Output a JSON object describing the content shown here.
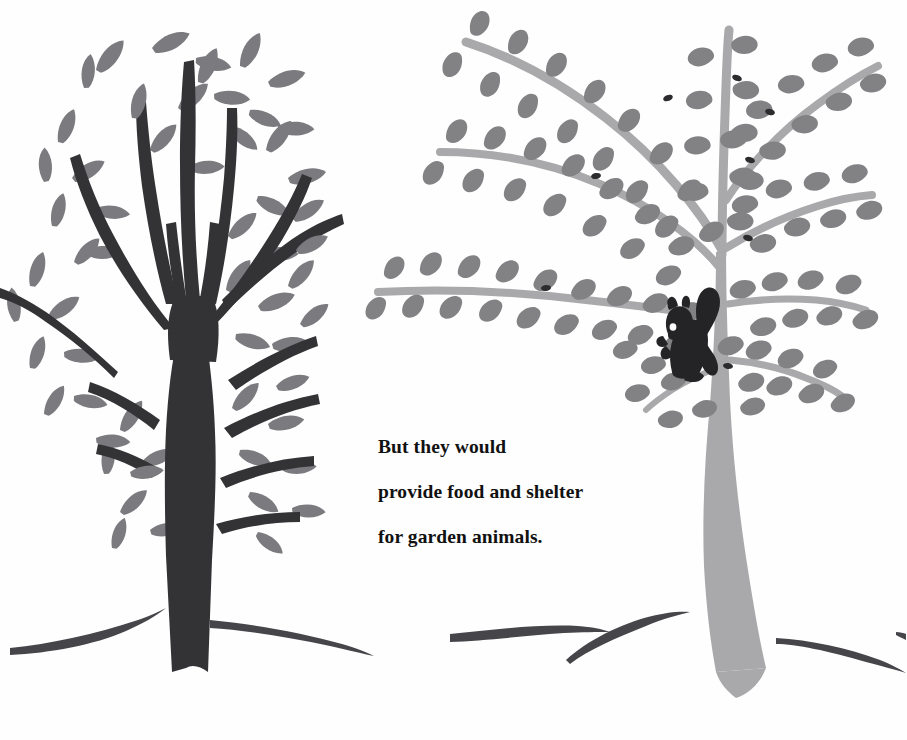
{
  "page": {
    "background_color": "#fefefe",
    "width": 907,
    "height": 740
  },
  "caption": {
    "full_text": "But they would provide food and shelter for garden animals.",
    "lines": [
      "But they would",
      "provide food and shelter",
      "for garden animals."
    ],
    "text_color": "#111111"
  },
  "palette": {
    "background": "#fefefe",
    "dark_tree": "#333235",
    "dark_tree_leaf": "#7b7a7e",
    "light_tree_trunk": "#a9a9ab",
    "light_tree_leaf": "#828285",
    "squirrel": "#242326",
    "squirrel_eye": "#fdfdfd",
    "ground_stroke": "#45454a"
  },
  "illustration": {
    "type": "paper-cut-collage",
    "description": "Two stylized trees on a white background with curved ground strokes and a squirrel.",
    "elements": [
      {
        "name": "dark-tree",
        "label": "Dark bare-branched tree with medium grey leaves",
        "side": "left",
        "trunk_color": "#333235",
        "leaf_color": "#7b7a7e"
      },
      {
        "name": "light-tree",
        "label": "Light grey weeping tree with darker grey leaves",
        "side": "right",
        "trunk_color": "#a9a9ab",
        "leaf_color": "#828285"
      },
      {
        "name": "squirrel",
        "label": "Squirrel silhouette perched on a branch of the light tree",
        "color": "#242326"
      },
      {
        "name": "ground-strokes",
        "label": "Five curved dark grey ground strokes across the bottom",
        "color": "#45454a",
        "count": 5
      }
    ]
  }
}
